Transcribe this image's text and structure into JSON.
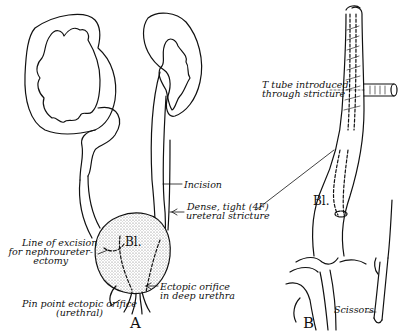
{
  "figure": {
    "panels": [
      {
        "id": "A",
        "label": "A"
      },
      {
        "id": "B",
        "label": "B"
      }
    ],
    "panel_a": {
      "bladder_label": "Bl.",
      "labels": {
        "incision": "Incision",
        "stricture_line1": "Dense, tight (4F)",
        "stricture_line2": "ureteral stricture",
        "excision_line1": "Line of excision",
        "excision_line2": "for nephroureter-",
        "excision_line3": "ectomy",
        "ectopic_line1": "Ectopic orifice",
        "ectopic_line2": "in deep urethra",
        "pinpoint_line1": "Pin point ectopic orifice",
        "pinpoint_line2": "(urethral)"
      }
    },
    "panel_b": {
      "bladder_label": "Bl.",
      "labels": {
        "ttube_line1": "T tube introduced",
        "ttube_line2": "through stricture",
        "scissors": "Scissors"
      }
    },
    "colors": {
      "ink": "#111111",
      "background": "#ffffff",
      "stipple": "#cfcfcf"
    }
  }
}
